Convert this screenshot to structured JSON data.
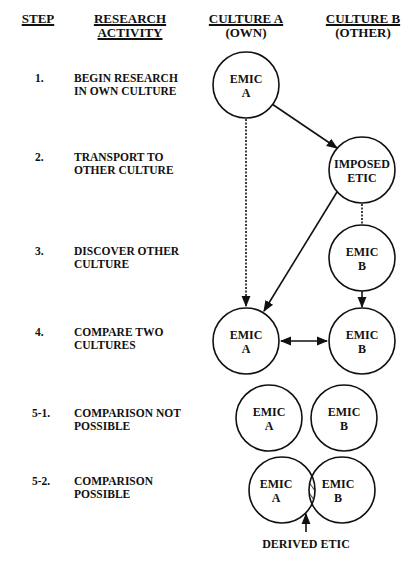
{
  "headers": {
    "step": "STEP",
    "activity_line1": "RESEARCH",
    "activity_line2": "ACTIVITY",
    "culture_a_line1": "CULTURE A",
    "culture_a_line2": "(OWN)",
    "culture_b_line1": "CULTURE B",
    "culture_b_line2": "(OTHER)"
  },
  "steps": [
    {
      "num": "1.",
      "line1": "BEGIN RESEARCH",
      "line2": "IN OWN CULTURE"
    },
    {
      "num": "2.",
      "line1": "TRANSPORT TO",
      "line2": "OTHER CULTURE"
    },
    {
      "num": "3.",
      "line1": "DISCOVER OTHER",
      "line2": "CULTURE"
    },
    {
      "num": "4.",
      "line1": "COMPARE TWO",
      "line2": "CULTURES"
    },
    {
      "num": "5-1.",
      "line1": "COMPARISON NOT",
      "line2": "POSSIBLE"
    },
    {
      "num": "5-2.",
      "line1": "COMPARISON",
      "line2": "POSSIBLE"
    }
  ],
  "nodes": {
    "s1_emic_a": {
      "line1": "EMIC",
      "line2": "A"
    },
    "s2_imposed_etic": {
      "line1": "IMPOSED",
      "line2": "ETIC"
    },
    "s3_emic_b": {
      "line1": "EMIC",
      "line2": "B"
    },
    "s4_emic_a": {
      "line1": "EMIC",
      "line2": "A"
    },
    "s4_emic_b": {
      "line1": "EMIC",
      "line2": "B"
    },
    "s51_emic_a": {
      "line1": "EMIC",
      "line2": "A"
    },
    "s51_emic_b": {
      "line1": "EMIC",
      "line2": "B"
    },
    "s52_emic_a": {
      "line1": "EMIC",
      "line2": "A"
    },
    "s52_emic_b": {
      "line1": "EMIC",
      "line2": "B"
    }
  },
  "derived_etic_label": "DERIVED ETIC",
  "colors": {
    "ink": "#111111",
    "background": "#ffffff"
  }
}
